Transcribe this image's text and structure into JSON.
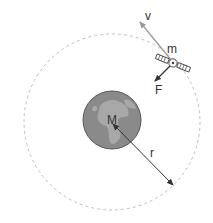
{
  "diagram": {
    "labels": {
      "velocity": "v",
      "satellite_mass": "m",
      "force": "F",
      "planet_mass": "M",
      "radius": "r"
    },
    "colors": {
      "orbit": "#b8b8b8",
      "planet_fill": "#8c8c8c",
      "continents": "#a9a9a9",
      "arrow_dark": "#333333",
      "arrow_light": "#999999"
    }
  }
}
